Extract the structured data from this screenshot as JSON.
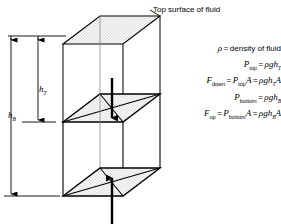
{
  "figure": {
    "title_label": "Top surface of fluid",
    "dimensions": [
      {
        "name": "h_T",
        "symbol": "h",
        "subscript": "T",
        "meaning": "depth to top face of block"
      },
      {
        "name": "h_B",
        "symbol": "h",
        "subscript": "B",
        "meaning": "depth to bottom face of block"
      }
    ],
    "equations": [
      {
        "id": "density",
        "lhs_symbol": "ρ",
        "lhs_sub": "",
        "equals": "=",
        "rhs_text": "density of fluid"
      },
      {
        "id": "p-top",
        "lhs_symbol": "P",
        "lhs_sub": "top",
        "equals": "=",
        "rhs_rho": "ρ",
        "rhs_gh": "gh",
        "rhs_sub": "T",
        "rhs_tail": ""
      },
      {
        "id": "f-down",
        "lhs_symbol": "F",
        "lhs_sub": "down",
        "equals": "=",
        "mid_symbol": "P",
        "mid_sub": "top",
        "mid_tail": "A",
        "equals2": "=",
        "rhs_rho": "ρ",
        "rhs_gh": "gh",
        "rhs_sub": "T",
        "rhs_tail": "A"
      },
      {
        "id": "p-bottom",
        "lhs_symbol": "P",
        "lhs_sub": "bottom",
        "equals": "=",
        "rhs_rho": "ρ",
        "rhs_gh": "gh",
        "rhs_sub": "B",
        "rhs_tail": ""
      },
      {
        "id": "f-up",
        "lhs_symbol": "F",
        "lhs_sub": "up",
        "equals": "=",
        "mid_symbol": "P",
        "mid_sub": "bottom",
        "mid_tail": "A",
        "equals2": "=",
        "rhs_rho": "ρ",
        "rhs_gh": "gh",
        "rhs_sub": "B",
        "rhs_tail": "A"
      }
    ],
    "forces": [
      {
        "name": "downward-force-arrow",
        "direction": "down",
        "applied_to": "top face of block"
      },
      {
        "name": "upward-force-arrow",
        "direction": "up",
        "applied_to": "bottom face of block"
      }
    ],
    "colors": {
      "line": "#000000",
      "shade_fill": "#e8e8e8",
      "background": "#ffffff",
      "dimension_line": "#000000"
    }
  }
}
